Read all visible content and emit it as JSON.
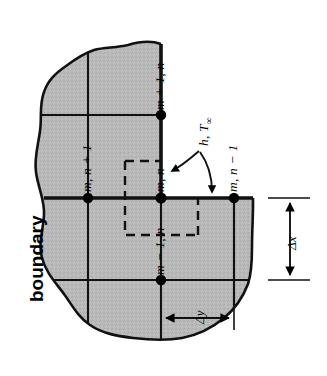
{
  "figure": {
    "title_word": "boundary",
    "type": "finite-difference nodal network at a plane surface with convection",
    "colors": {
      "solid_fill": "#b7b7b7",
      "outline": "#111111",
      "grid_line": "#111111",
      "node": "#000000",
      "background": "#ffffff"
    },
    "labels": {
      "node_m_plus_1_n": "m + 1, n",
      "node_m_n_plus_1": "m, n + 1",
      "node_m_n": "m, n",
      "node_m_minus_1_n": "m − 1, n",
      "node_m_n_minus_1": "m, n − 1",
      "convection": "h, T",
      "convection_sub": "∞",
      "delta_x": "Δx",
      "delta_y": "Δy"
    }
  }
}
